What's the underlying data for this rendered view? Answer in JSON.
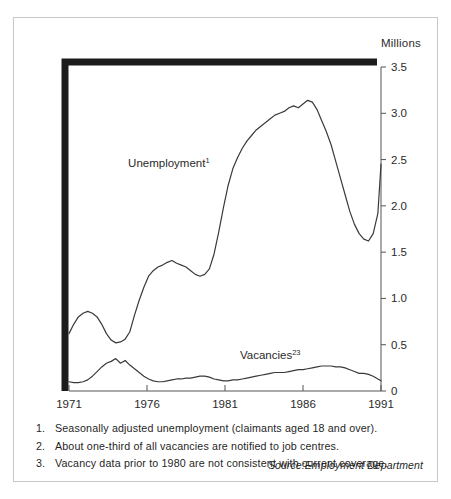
{
  "figure": {
    "axis_unit_label": "Millions",
    "source_note": "Source:Employment Department",
    "footnotes": [
      {
        "num": "1.",
        "text": "Seasonally adjusted unemployment (claimants aged 18 and over)."
      },
      {
        "num": "2.",
        "text": "About one-third of all vacancies are notified to job centres."
      },
      {
        "num": "3.",
        "text": "Vacancy data prior to 1980 are not consistent with current coverage."
      }
    ]
  },
  "chart_data": {
    "type": "line",
    "title": "",
    "subtitle": "",
    "xlabel": "",
    "ylabel": "Millions",
    "xlim": [
      1971,
      1991
    ],
    "ylim": [
      0,
      3.5
    ],
    "xticks": [
      1971,
      1976,
      1981,
      1986,
      1991
    ],
    "xtick_labels": [
      "1971",
      "1976",
      "1981",
      "1986",
      "1991"
    ],
    "yticks": [
      0,
      0.5,
      1.0,
      1.5,
      2.0,
      2.5,
      3.0,
      3.5
    ],
    "ytick_labels": [
      "0",
      "0.5",
      "1.0",
      "1.5",
      "2.0",
      "2.5",
      "3.0",
      "3.5"
    ],
    "yaxis_position": "right",
    "grid": false,
    "legend": "inline-annotations",
    "line_color": "#3a3a3a",
    "annotations": [
      {
        "name": "unemployment-label",
        "text": "Unemployment",
        "sup": "1",
        "x": 1977.4,
        "y": 2.42
      },
      {
        "name": "vacancies-label",
        "text": "Vacancies",
        "sup": "23",
        "x": 1983.9,
        "y": 0.35
      }
    ],
    "series": [
      {
        "name": "Unemployment",
        "footnote": "1",
        "x": [
          1971.0,
          1971.3,
          1971.6,
          1971.9,
          1972.2,
          1972.5,
          1972.8,
          1973.1,
          1973.4,
          1973.7,
          1974.0,
          1974.3,
          1974.6,
          1974.9,
          1975.2,
          1975.5,
          1975.8,
          1976.1,
          1976.4,
          1976.7,
          1977.0,
          1977.3,
          1977.6,
          1977.9,
          1978.2,
          1978.5,
          1978.8,
          1979.1,
          1979.4,
          1979.7,
          1980.0,
          1980.3,
          1980.6,
          1980.9,
          1981.2,
          1981.5,
          1981.8,
          1982.1,
          1982.4,
          1982.7,
          1983.0,
          1983.3,
          1983.6,
          1983.9,
          1984.2,
          1984.5,
          1984.8,
          1985.1,
          1985.4,
          1985.7,
          1986.0,
          1986.3,
          1986.6,
          1986.9,
          1987.2,
          1987.5,
          1987.8,
          1988.1,
          1988.4,
          1988.7,
          1989.0,
          1989.3,
          1989.6,
          1989.9,
          1990.2,
          1990.5,
          1990.8,
          1991.0
        ],
        "y": [
          0.62,
          0.72,
          0.8,
          0.84,
          0.86,
          0.84,
          0.8,
          0.72,
          0.62,
          0.55,
          0.52,
          0.53,
          0.56,
          0.64,
          0.82,
          0.98,
          1.12,
          1.24,
          1.3,
          1.34,
          1.36,
          1.39,
          1.41,
          1.38,
          1.36,
          1.34,
          1.3,
          1.26,
          1.24,
          1.26,
          1.32,
          1.48,
          1.72,
          1.98,
          2.22,
          2.4,
          2.52,
          2.62,
          2.7,
          2.76,
          2.82,
          2.86,
          2.9,
          2.94,
          2.98,
          3.0,
          3.02,
          3.06,
          3.08,
          3.06,
          3.1,
          3.14,
          3.12,
          3.04,
          2.92,
          2.8,
          2.66,
          2.48,
          2.3,
          2.12,
          1.94,
          1.8,
          1.7,
          1.64,
          1.62,
          1.7,
          1.92,
          2.45
        ]
      },
      {
        "name": "Vacancies",
        "footnote": "23",
        "x": [
          1971.0,
          1971.3,
          1971.6,
          1971.9,
          1972.2,
          1972.5,
          1972.8,
          1973.1,
          1973.4,
          1973.7,
          1974.0,
          1974.3,
          1974.6,
          1974.9,
          1975.2,
          1975.5,
          1975.8,
          1976.1,
          1976.4,
          1976.7,
          1977.0,
          1977.3,
          1977.6,
          1977.9,
          1978.2,
          1978.5,
          1978.8,
          1979.1,
          1979.4,
          1979.7,
          1980.0,
          1980.3,
          1980.6,
          1980.9,
          1981.2,
          1981.5,
          1981.8,
          1982.1,
          1982.4,
          1982.7,
          1983.0,
          1983.3,
          1983.6,
          1983.9,
          1984.2,
          1984.5,
          1984.8,
          1985.1,
          1985.4,
          1985.7,
          1986.0,
          1986.3,
          1986.6,
          1986.9,
          1987.2,
          1987.5,
          1987.8,
          1988.1,
          1988.4,
          1988.7,
          1989.0,
          1989.3,
          1989.6,
          1989.9,
          1990.2,
          1990.5,
          1990.8,
          1991.0
        ],
        "y": [
          0.1,
          0.09,
          0.09,
          0.1,
          0.12,
          0.16,
          0.21,
          0.26,
          0.3,
          0.32,
          0.35,
          0.3,
          0.33,
          0.28,
          0.24,
          0.2,
          0.16,
          0.13,
          0.11,
          0.1,
          0.1,
          0.11,
          0.12,
          0.13,
          0.13,
          0.14,
          0.14,
          0.15,
          0.16,
          0.16,
          0.15,
          0.13,
          0.12,
          0.11,
          0.11,
          0.12,
          0.12,
          0.13,
          0.14,
          0.15,
          0.16,
          0.17,
          0.18,
          0.19,
          0.2,
          0.2,
          0.2,
          0.21,
          0.22,
          0.23,
          0.23,
          0.24,
          0.25,
          0.26,
          0.27,
          0.27,
          0.27,
          0.26,
          0.26,
          0.25,
          0.23,
          0.21,
          0.19,
          0.19,
          0.18,
          0.16,
          0.13,
          0.11
        ]
      }
    ]
  }
}
